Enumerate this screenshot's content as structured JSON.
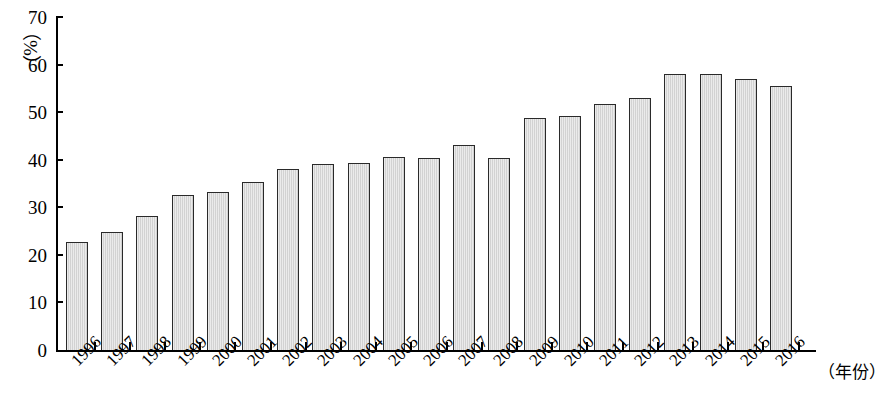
{
  "chart_data": {
    "type": "bar",
    "title": "",
    "subtitle": "",
    "xlabel": "（年份）",
    "ylabel": "（%）",
    "ylim": [
      0,
      70
    ],
    "ytick_values": [
      0,
      10,
      20,
      30,
      40,
      50,
      60,
      70
    ],
    "ytick_labels": [
      "0",
      "10",
      "20",
      "30",
      "40",
      "50",
      "60",
      "70"
    ],
    "grid": false,
    "legend": null,
    "categories": [
      "1996",
      "1997",
      "1998",
      "1999",
      "2000",
      "2001",
      "2002",
      "2003",
      "2004",
      "2005",
      "2006",
      "2007",
      "2008",
      "2009",
      "2010",
      "2011",
      "2012",
      "2013",
      "2014",
      "2015",
      "2016"
    ],
    "values": [
      22.7,
      24.8,
      28.2,
      32.6,
      33.2,
      35.3,
      38.1,
      39.2,
      39.4,
      40.6,
      40.3,
      43.1,
      40.4,
      48.8,
      49.1,
      51.7,
      52.9,
      58.0,
      58.0,
      57.0,
      55.6
    ],
    "series": [
      {
        "name": "",
        "values": [
          22.7,
          24.8,
          28.2,
          32.6,
          33.2,
          35.3,
          38.1,
          39.2,
          39.4,
          40.6,
          40.3,
          43.1,
          40.4,
          48.8,
          49.1,
          51.7,
          52.9,
          58.0,
          58.0,
          57.0,
          55.6
        ]
      }
    ],
    "bar_fill_color": "#d2d2d2",
    "bar_border_color": "#2a2a2a",
    "axis_color": "#000000"
  }
}
